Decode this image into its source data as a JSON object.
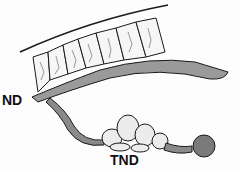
{
  "figure": {
    "type": "anatomical line illustration",
    "labels": {
      "nd": "ND",
      "tnd": "TND"
    },
    "structures": [
      {
        "id": "nd",
        "label": "ND",
        "description": "upper duct with segmented chambers along a curved body wall"
      },
      {
        "id": "tnd",
        "label": "TND",
        "description": "lower branching duct ending in lobulated mass and rounded bulb"
      }
    ],
    "colors": {
      "ink": "#1a1a1a",
      "background": "#fdfdfd",
      "shade": "#8a8a8a"
    }
  }
}
